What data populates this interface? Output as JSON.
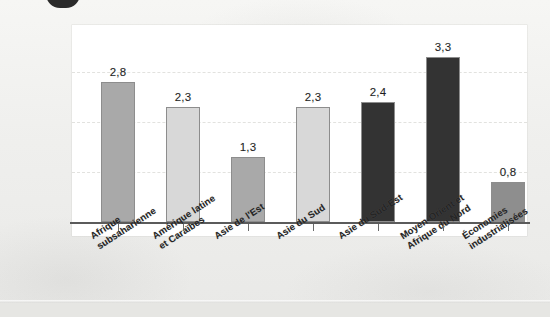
{
  "chart_data": {
    "type": "bar",
    "title": "",
    "subtitle": "",
    "xlabel": "",
    "ylabel": "",
    "ylim": [
      0,
      3.8
    ],
    "grid": true,
    "gridlines": [
      1.0,
      2.0,
      3.0
    ],
    "legend": "none",
    "decimal_separator": ",",
    "categories": [
      "Afrique subsaharienne",
      "Amérique latine et Caraïbes",
      "Asie de l'Est",
      "Asie du Sud",
      "Asie du Sud-Est",
      "Moyen-Orient et Afrique du Nord",
      "Économies industrialisées"
    ],
    "values": [
      2.8,
      2.3,
      1.3,
      2.3,
      2.4,
      3.3,
      0.8
    ],
    "value_labels": [
      "2,8",
      "2,3",
      "1,3",
      "2,3",
      "2,4",
      "3,3",
      "0,8"
    ],
    "bar_colors": [
      "#a9a9a9",
      "#d8d8d8",
      "#a9a9a9",
      "#d8d8d8",
      "#333333",
      "#333333",
      "#8e8e8e"
    ]
  },
  "bars": [
    {
      "label": "2,8",
      "value": 2.8,
      "color": "#a9a9a9",
      "name_line1": "Afrique",
      "name_line2": "subsaharienne"
    },
    {
      "label": "2,3",
      "value": 2.3,
      "color": "#d8d8d8",
      "name_line1": "Amérique latine",
      "name_line2": "et Caraïbes"
    },
    {
      "label": "1,3",
      "value": 1.3,
      "color": "#a9a9a9",
      "name_line1": "Asie de l'Est",
      "name_line2": ""
    },
    {
      "label": "2,3",
      "value": 2.3,
      "color": "#d8d8d8",
      "name_line1": "Asie du Sud",
      "name_line2": ""
    },
    {
      "label": "2,4",
      "value": 2.4,
      "color": "#333333",
      "name_line1": "Asie du Sud-Est",
      "name_line2": ""
    },
    {
      "label": "3,3",
      "value": 3.3,
      "color": "#333333",
      "name_line1": "Moyen-Orient et",
      "name_line2": "Afrique du Nord"
    },
    {
      "label": "0,8",
      "value": 0.8,
      "color": "#8e8e8e",
      "name_line1": "Économies",
      "name_line2": "industrialisées"
    }
  ]
}
